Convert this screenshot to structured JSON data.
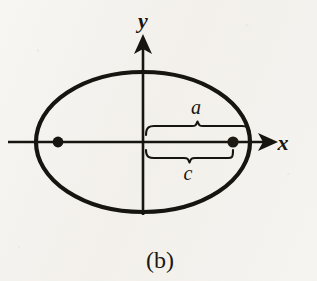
{
  "figure": {
    "caption": "(b)",
    "background_color": "#f5f3ef",
    "ink_color": "#17150f"
  },
  "axes": {
    "x_label": "x",
    "y_label": "y",
    "origin": {
      "x": 143,
      "y": 142
    }
  },
  "ellipse": {
    "center": {
      "x": 143,
      "y": 142
    },
    "semi_major_axis_px": 107,
    "semi_minor_axis_px": 70,
    "stroke_width_px": 4
  },
  "foci": [
    {
      "name": "left-focus",
      "x": 58,
      "y": 142,
      "radius_px": 5
    },
    {
      "name": "right-focus",
      "x": 233,
      "y": 142,
      "radius_px": 5
    }
  ],
  "measures": [
    {
      "id": "a",
      "label": "a",
      "meaning": "semi-major axis: center to right vertex",
      "from_x": 145,
      "to_x": 250,
      "brace_y": 124,
      "label_x": 196,
      "label_y": 114,
      "side": "above"
    },
    {
      "id": "c",
      "label": "c",
      "meaning": "focal distance: center to right focus",
      "from_x": 145,
      "to_x": 233,
      "brace_y": 160,
      "label_x": 188,
      "label_y": 179,
      "side": "below"
    }
  ]
}
